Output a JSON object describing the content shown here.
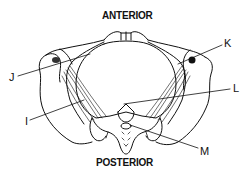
{
  "diagram": {
    "orientation": {
      "top": "ANTERIOR",
      "bottom": "POSTERIOR"
    },
    "labels": [
      {
        "id": "I",
        "text": "I"
      },
      {
        "id": "J",
        "text": "J"
      },
      {
        "id": "K",
        "text": "K"
      },
      {
        "id": "L",
        "text": "L"
      },
      {
        "id": "M",
        "text": "M"
      }
    ],
    "colors": {
      "line": "#111111",
      "background": "#ffffff"
    }
  }
}
